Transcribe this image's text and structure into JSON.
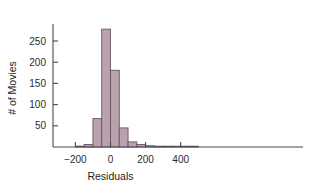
{
  "chart_data": {
    "type": "bar",
    "title": "",
    "subtitle": "",
    "xlabel": "Residuals",
    "ylabel": "# of Movies",
    "xlim": [
      -210,
      510
    ],
    "ylim": [
      0,
      290
    ],
    "xticks": [
      -200,
      0,
      200,
      400
    ],
    "xtick_labels": [
      "-200",
      "0",
      "200",
      "400"
    ],
    "yticks": [
      50,
      100,
      150,
      200,
      250
    ],
    "ytick_labels": [
      "50",
      "100",
      "150",
      "200",
      "250"
    ],
    "grid": false,
    "legend": null,
    "bin_width": 50,
    "bins": [
      {
        "left": -200,
        "right": -150,
        "value": 2
      },
      {
        "left": -150,
        "right": -100,
        "value": 6
      },
      {
        "left": -100,
        "right": -50,
        "value": 67
      },
      {
        "left": -50,
        "right": 0,
        "value": 278
      },
      {
        "left": 0,
        "right": 50,
        "value": 181
      },
      {
        "left": 50,
        "right": 100,
        "value": 45
      },
      {
        "left": 100,
        "right": 150,
        "value": 12
      },
      {
        "left": 150,
        "right": 200,
        "value": 6
      },
      {
        "left": 200,
        "right": 250,
        "value": 3
      },
      {
        "left": 250,
        "right": 300,
        "value": 1
      },
      {
        "left": 300,
        "right": 350,
        "value": 1
      },
      {
        "left": 350,
        "right": 400,
        "value": 1
      },
      {
        "left": 400,
        "right": 450,
        "value": 1
      },
      {
        "left": 450,
        "right": 500,
        "value": 1
      }
    ],
    "categories": [
      "-200",
      "-150",
      "-100",
      "-50",
      "0",
      "50",
      "100",
      "150",
      "200",
      "250",
      "300",
      "350",
      "400",
      "450"
    ],
    "values": [
      2,
      6,
      67,
      278,
      181,
      45,
      12,
      6,
      3,
      1,
      1,
      1,
      1,
      1
    ],
    "colors": {
      "bar_fill": "#b9a2ae",
      "bar_edge": "#6a5560",
      "axis": "#4a4a4a",
      "text": "#1d1d1d",
      "background": "#ffffff"
    }
  }
}
